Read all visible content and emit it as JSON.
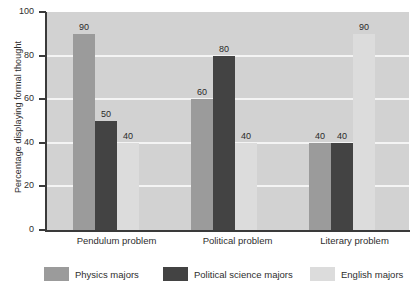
{
  "chart_data": {
    "type": "bar",
    "title": "",
    "xlabel": "",
    "ylabel": "Percentage displaying formal thought",
    "ylim": [
      0,
      100
    ],
    "yticks": [
      0,
      20,
      40,
      60,
      80,
      100
    ],
    "ytick_labels": [
      "0",
      "20",
      "40",
      "60",
      "80",
      "100"
    ],
    "grid": true,
    "grid_axis": "y",
    "legend_position": "bottom",
    "categories": [
      "Pendulum problem",
      "Political problem",
      "Literary problem"
    ],
    "series": [
      {
        "name": "Physics majors",
        "color": "#9b9b9b",
        "values": [
          90,
          60,
          40
        ]
      },
      {
        "name": "Political science majors",
        "color": "#434343",
        "values": [
          50,
          80,
          40
        ]
      },
      {
        "name": "English majors",
        "color": "#dcdcdc",
        "values": [
          40,
          40,
          90
        ]
      }
    ],
    "data_labels": [
      [
        "90",
        "50",
        "40"
      ],
      [
        "60",
        "80",
        "40"
      ],
      [
        "40",
        "40",
        "90"
      ]
    ]
  },
  "axis": {
    "y_title": "Percentage displaying formal thought"
  },
  "legend": {
    "items": [
      {
        "label": "Physics majors"
      },
      {
        "label": "Political science majors"
      },
      {
        "label": "English majors"
      }
    ]
  },
  "caption": {
    "text": ""
  },
  "colors": {
    "plot_background": "#d2d2d2",
    "gridline": "#f4f4f4",
    "axis": "#3a3a3a",
    "physics": "#9b9b9b",
    "polisci": "#434343",
    "english": "#dcdcdc"
  }
}
